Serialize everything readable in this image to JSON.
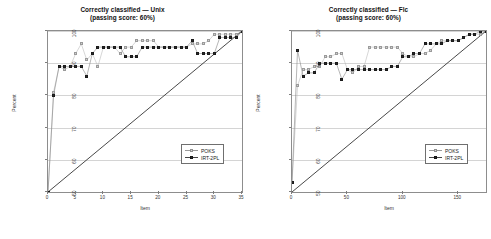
{
  "figure": {
    "background": "#ffffff",
    "series_colors": {
      "poks": "#cfcfcf",
      "irt_2pl": "#2b2b2b",
      "reference_line": "#333333"
    }
  },
  "chart_data": [
    {
      "type": "scatter",
      "panel": "left",
      "title": "Correctly classified — Unix",
      "subtitle": "(passing score: 60%)",
      "xlabel": "Item",
      "ylabel": "Percent",
      "xlim": [
        0,
        35
      ],
      "ylim": [
        50,
        100
      ],
      "xticks": [
        0,
        5,
        10,
        15,
        20,
        25,
        30,
        35
      ],
      "yticks": [
        50,
        60,
        70,
        80,
        90,
        100
      ],
      "grid": true,
      "legend_position": "lower right",
      "legend": [
        "POKS",
        "IRT-2PL"
      ],
      "series": [
        {
          "name": "POKS",
          "marker": "open-square",
          "x": [
            0,
            1,
            2,
            3,
            4,
            5,
            6,
            7,
            8,
            9,
            10,
            11,
            12,
            13,
            14,
            15,
            16,
            17,
            18,
            19,
            20,
            21,
            22,
            23,
            24,
            25,
            26,
            27,
            28,
            29,
            30,
            31,
            32,
            33,
            34,
            35
          ],
          "y": [
            50,
            81,
            89,
            88,
            89,
            93,
            96,
            91,
            93,
            89,
            95,
            95,
            95,
            93,
            95,
            95,
            97,
            97,
            97,
            97,
            95,
            95,
            95,
            95,
            95,
            95,
            96,
            96,
            96,
            97,
            99,
            99,
            99,
            99,
            99,
            100
          ]
        },
        {
          "name": "IRT-2PL",
          "marker": "filled-square",
          "x": [
            0,
            1,
            2,
            3,
            4,
            5,
            6,
            7,
            8,
            9,
            10,
            11,
            12,
            13,
            14,
            15,
            16,
            17,
            18,
            19,
            20,
            21,
            22,
            23,
            24,
            25,
            26,
            27,
            28,
            29,
            30,
            31,
            32,
            33,
            34,
            35
          ],
          "y": [
            50,
            80,
            89,
            89,
            89,
            89,
            89,
            86,
            93,
            95,
            95,
            95,
            95,
            95,
            92,
            92,
            92,
            95,
            95,
            95,
            95,
            95,
            95,
            95,
            95,
            95,
            97,
            93,
            93,
            93,
            93,
            98,
            98,
            98,
            98,
            100
          ]
        },
        {
          "name": "reference-line",
          "marker": "none",
          "x": [
            0,
            35
          ],
          "y": [
            50,
            100
          ]
        }
      ]
    },
    {
      "type": "scatter",
      "panel": "right",
      "title": "Correctly classified — Flc",
      "subtitle": "(passing score: 60%)",
      "xlabel": "Item",
      "ylabel": "Percent",
      "xlim": [
        0,
        175
      ],
      "ylim": [
        50,
        100
      ],
      "xticks": [
        0,
        50,
        100,
        150
      ],
      "yticks": [
        50,
        60,
        70,
        80,
        90,
        100
      ],
      "grid": true,
      "legend_position": "lower right",
      "legend": [
        "POKS",
        "IRT-2PL"
      ],
      "series": [
        {
          "name": "POKS",
          "marker": "open-square",
          "x": [
            0,
            5,
            10,
            15,
            20,
            25,
            30,
            35,
            40,
            45,
            50,
            55,
            60,
            65,
            70,
            75,
            80,
            85,
            90,
            95,
            100,
            105,
            110,
            115,
            120,
            125,
            130,
            135,
            140,
            145,
            150,
            155,
            160,
            165,
            170,
            175
          ],
          "y": [
            53,
            83,
            88,
            88,
            89,
            89,
            92,
            92,
            93,
            93,
            88,
            87,
            89,
            89,
            95,
            95,
            95,
            95,
            95,
            95,
            93,
            92,
            92,
            93,
            93,
            94,
            96,
            97,
            97,
            97,
            97,
            98,
            99,
            99,
            99,
            100
          ]
        },
        {
          "name": "IRT-2PL",
          "marker": "filled-square",
          "x": [
            0,
            5,
            10,
            15,
            20,
            25,
            30,
            35,
            40,
            45,
            50,
            55,
            60,
            65,
            70,
            75,
            80,
            85,
            90,
            95,
            100,
            105,
            110,
            115,
            120,
            125,
            130,
            135,
            140,
            145,
            150,
            155,
            160,
            165,
            170,
            175
          ],
          "y": [
            53,
            94,
            86,
            87,
            87,
            90,
            90,
            90,
            90,
            85,
            88,
            88,
            88,
            88,
            88,
            88,
            88,
            88,
            89,
            89,
            92,
            92,
            93,
            93,
            96,
            96,
            96,
            96,
            97,
            97,
            97,
            98,
            99,
            99,
            100,
            100
          ]
        },
        {
          "name": "reference-line",
          "marker": "none",
          "x": [
            0,
            175
          ],
          "y": [
            50,
            100
          ]
        }
      ]
    }
  ]
}
